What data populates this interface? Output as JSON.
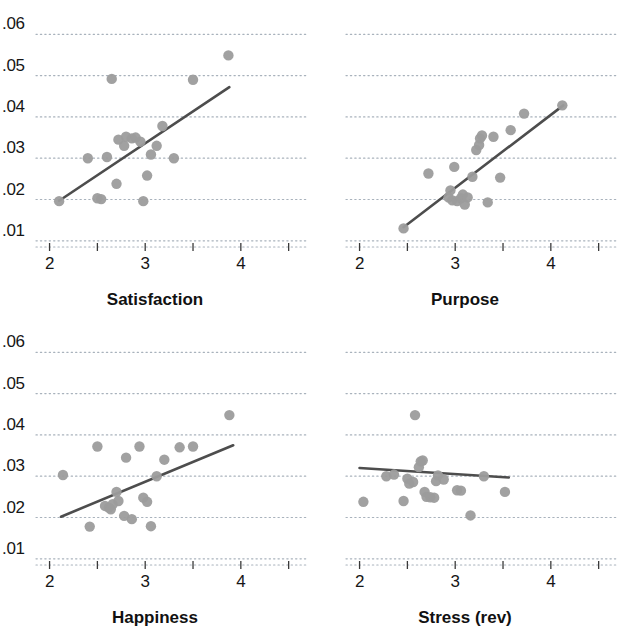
{
  "figure": {
    "title": "",
    "background": "#ffffff",
    "marker_color": "#9c9c9c",
    "line_color": "#4d4d4d",
    "grid_color": "#9aa5b1",
    "axis_color": "#3a3a3a",
    "rows": 2,
    "cols": 2
  },
  "chart_data": [
    {
      "type": "scatter",
      "title": "Satisfaction",
      "xlabel": "Satisfaction",
      "ylabel": "",
      "xlim": [
        1.9,
        4.65
      ],
      "ylim": [
        0.0085,
        0.0625
      ],
      "xticks": [
        2,
        2.5,
        3,
        3.5,
        4,
        4.5
      ],
      "xticklabels": [
        "2",
        "",
        "3",
        "",
        "4",
        ""
      ],
      "yticks": [
        0.01,
        0.02,
        0.03,
        0.04,
        0.05,
        0.06
      ],
      "yticklabels": [
        ".01",
        ".02",
        ".03",
        ".04",
        ".05",
        ".06"
      ],
      "grid": true,
      "grid_style": "dotted",
      "legend": "none",
      "points": [
        {
          "x": 2.1,
          "y": 0.0196
        },
        {
          "x": 2.4,
          "y": 0.03
        },
        {
          "x": 2.5,
          "y": 0.0203
        },
        {
          "x": 2.54,
          "y": 0.0201
        },
        {
          "x": 2.6,
          "y": 0.0303
        },
        {
          "x": 2.65,
          "y": 0.0492
        },
        {
          "x": 2.7,
          "y": 0.0238
        },
        {
          "x": 2.72,
          "y": 0.0345
        },
        {
          "x": 2.78,
          "y": 0.033
        },
        {
          "x": 2.8,
          "y": 0.0352
        },
        {
          "x": 2.86,
          "y": 0.0348
        },
        {
          "x": 2.9,
          "y": 0.035
        },
        {
          "x": 2.95,
          "y": 0.034
        },
        {
          "x": 2.98,
          "y": 0.0196
        },
        {
          "x": 3.02,
          "y": 0.0258
        },
        {
          "x": 3.06,
          "y": 0.0309
        },
        {
          "x": 3.12,
          "y": 0.033
        },
        {
          "x": 3.18,
          "y": 0.0378
        },
        {
          "x": 3.3,
          "y": 0.03
        },
        {
          "x": 3.5,
          "y": 0.049
        },
        {
          "x": 3.87,
          "y": 0.0549
        }
      ],
      "fit_line": {
        "x0": 2.1,
        "y0": 0.0197,
        "x1": 3.88,
        "y1": 0.0472
      }
    },
    {
      "type": "scatter",
      "title": "Purpose",
      "xlabel": "Purpose",
      "ylabel": "",
      "xlim": [
        1.9,
        4.65
      ],
      "ylim": [
        0.0085,
        0.0625
      ],
      "xticks": [
        2,
        2.5,
        3,
        3.5,
        4,
        4.5
      ],
      "xticklabels": [
        "2",
        "",
        "3",
        "",
        "4",
        ""
      ],
      "yticks": [
        0.01,
        0.02,
        0.03,
        0.04,
        0.05,
        0.06
      ],
      "yticklabels": [
        ".01",
        ".02",
        ".03",
        ".04",
        ".05",
        ".06"
      ],
      "grid": true,
      "grid_style": "dotted",
      "legend": "none",
      "points": [
        {
          "x": 2.46,
          "y": 0.013
        },
        {
          "x": 2.72,
          "y": 0.0263
        },
        {
          "x": 2.93,
          "y": 0.0205
        },
        {
          "x": 2.95,
          "y": 0.0222
        },
        {
          "x": 2.97,
          "y": 0.0198
        },
        {
          "x": 2.99,
          "y": 0.0279
        },
        {
          "x": 3.02,
          "y": 0.0196
        },
        {
          "x": 3.06,
          "y": 0.0203
        },
        {
          "x": 3.08,
          "y": 0.0212
        },
        {
          "x": 3.1,
          "y": 0.0188
        },
        {
          "x": 3.13,
          "y": 0.0205
        },
        {
          "x": 3.18,
          "y": 0.0255
        },
        {
          "x": 3.22,
          "y": 0.032
        },
        {
          "x": 3.25,
          "y": 0.0332
        },
        {
          "x": 3.26,
          "y": 0.0348
        },
        {
          "x": 3.28,
          "y": 0.0355
        },
        {
          "x": 3.34,
          "y": 0.0193
        },
        {
          "x": 3.4,
          "y": 0.0352
        },
        {
          "x": 3.47,
          "y": 0.0253
        },
        {
          "x": 3.58,
          "y": 0.0368
        },
        {
          "x": 3.72,
          "y": 0.0408
        },
        {
          "x": 4.12,
          "y": 0.0428
        }
      ],
      "fit_line": {
        "x0": 2.46,
        "y0": 0.0133,
        "x1": 4.13,
        "y1": 0.0428
      }
    },
    {
      "type": "scatter",
      "title": "Happiness",
      "xlabel": "Happiness",
      "ylabel": "",
      "xlim": [
        1.9,
        4.65
      ],
      "ylim": [
        0.0085,
        0.0625
      ],
      "xticks": [
        2,
        2.5,
        3,
        3.5,
        4,
        4.5
      ],
      "xticklabels": [
        "2",
        "",
        "3",
        "",
        "4",
        ""
      ],
      "yticks": [
        0.01,
        0.02,
        0.03,
        0.04,
        0.05,
        0.06
      ],
      "yticklabels": [
        ".01",
        ".02",
        ".03",
        ".04",
        ".05",
        ".06"
      ],
      "grid": true,
      "grid_style": "dotted",
      "legend": "none",
      "points": [
        {
          "x": 2.14,
          "y": 0.0303
        },
        {
          "x": 2.42,
          "y": 0.0178
        },
        {
          "x": 2.5,
          "y": 0.0372
        },
        {
          "x": 2.58,
          "y": 0.0228
        },
        {
          "x": 2.62,
          "y": 0.0224
        },
        {
          "x": 2.64,
          "y": 0.022
        },
        {
          "x": 2.66,
          "y": 0.0232
        },
        {
          "x": 2.7,
          "y": 0.0262
        },
        {
          "x": 2.72,
          "y": 0.024
        },
        {
          "x": 2.78,
          "y": 0.0204
        },
        {
          "x": 2.8,
          "y": 0.0345
        },
        {
          "x": 2.86,
          "y": 0.0196
        },
        {
          "x": 2.94,
          "y": 0.0372
        },
        {
          "x": 2.98,
          "y": 0.0248
        },
        {
          "x": 3.02,
          "y": 0.0238
        },
        {
          "x": 3.06,
          "y": 0.0179
        },
        {
          "x": 3.12,
          "y": 0.03
        },
        {
          "x": 3.2,
          "y": 0.034
        },
        {
          "x": 3.36,
          "y": 0.037
        },
        {
          "x": 3.5,
          "y": 0.0372
        },
        {
          "x": 3.88,
          "y": 0.0448
        }
      ],
      "fit_line": {
        "x0": 2.12,
        "y0": 0.0202,
        "x1": 3.92,
        "y1": 0.0375
      }
    },
    {
      "type": "scatter",
      "title": "Stress (rev)",
      "xlabel": "Stress (rev)",
      "ylabel": "",
      "xlim": [
        1.9,
        4.65
      ],
      "ylim": [
        0.0085,
        0.0625
      ],
      "xticks": [
        2,
        2.5,
        3,
        3.5,
        4,
        4.5
      ],
      "xticklabels": [
        "2",
        "",
        "3",
        "",
        "4",
        ""
      ],
      "yticks": [
        0.01,
        0.02,
        0.03,
        0.04,
        0.05,
        0.06
      ],
      "yticklabels": [
        ".01",
        ".02",
        ".03",
        ".04",
        ".05",
        ".06"
      ],
      "grid": true,
      "grid_style": "dotted",
      "legend": "none",
      "points": [
        {
          "x": 2.04,
          "y": 0.0238
        },
        {
          "x": 2.28,
          "y": 0.03
        },
        {
          "x": 2.36,
          "y": 0.0304
        },
        {
          "x": 2.46,
          "y": 0.024
        },
        {
          "x": 2.5,
          "y": 0.0294
        },
        {
          "x": 2.52,
          "y": 0.0282
        },
        {
          "x": 2.56,
          "y": 0.0286
        },
        {
          "x": 2.58,
          "y": 0.0448
        },
        {
          "x": 2.62,
          "y": 0.0322
        },
        {
          "x": 2.64,
          "y": 0.0336
        },
        {
          "x": 2.66,
          "y": 0.0338
        },
        {
          "x": 2.68,
          "y": 0.0262
        },
        {
          "x": 2.7,
          "y": 0.025
        },
        {
          "x": 2.74,
          "y": 0.0249
        },
        {
          "x": 2.78,
          "y": 0.0248
        },
        {
          "x": 2.8,
          "y": 0.0288
        },
        {
          "x": 2.82,
          "y": 0.0302
        },
        {
          "x": 2.88,
          "y": 0.0292
        },
        {
          "x": 3.02,
          "y": 0.0266
        },
        {
          "x": 3.06,
          "y": 0.0265
        },
        {
          "x": 3.16,
          "y": 0.0205
        },
        {
          "x": 3.3,
          "y": 0.03
        },
        {
          "x": 3.52,
          "y": 0.0262
        }
      ],
      "fit_line": {
        "x0": 2.0,
        "y0": 0.032,
        "x1": 3.56,
        "y1": 0.0297
      }
    }
  ]
}
